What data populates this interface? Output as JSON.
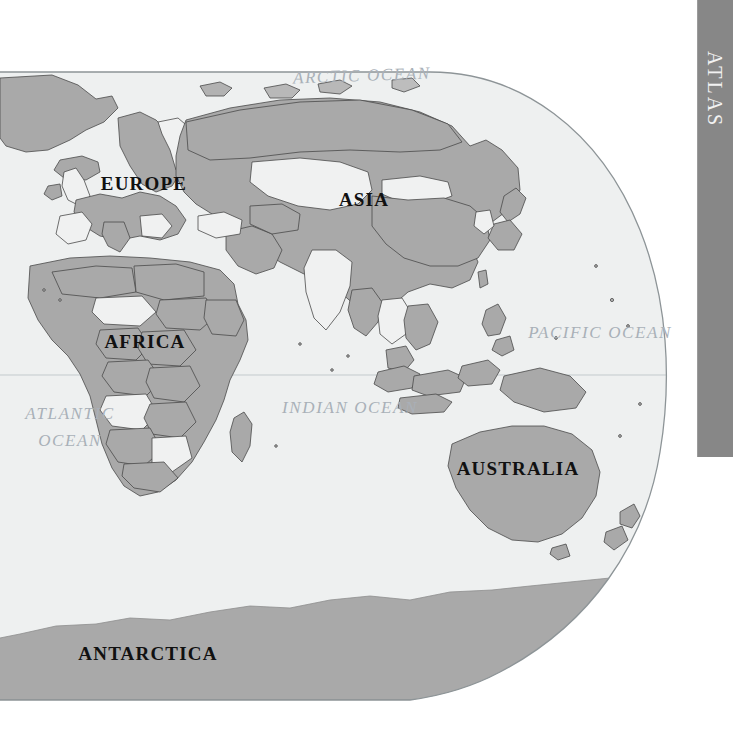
{
  "page": {
    "kind": "atlas-world-map-page",
    "background_color": "#ffffff",
    "width": 733,
    "height": 732
  },
  "tab": {
    "label": "ATLAS",
    "color": "#878787",
    "text_color": "#f2f2f2",
    "orientation": "vertical"
  },
  "map": {
    "projection_note": "oval / elliptical eastern-hemisphere world map",
    "ocean_color": "#eef0f0",
    "land_color": "#a9a9a9",
    "land_alt_color": "#f0f1f1",
    "border_color": "#4a4a4a",
    "outline_color": "#9aa0a3",
    "equator_color": "#b9c2c6",
    "continent_labels": [
      {
        "name": "europe",
        "text": "EUROPE",
        "x": 144,
        "y": 190,
        "size": 19
      },
      {
        "name": "asia",
        "text": "ASIA",
        "x": 364,
        "y": 206,
        "size": 19
      },
      {
        "name": "africa",
        "text": "AFRICA",
        "x": 145,
        "y": 348,
        "size": 19
      },
      {
        "name": "australia",
        "text": "AUSTRALIA",
        "x": 518,
        "y": 475,
        "size": 19
      },
      {
        "name": "antarctica",
        "text": "ANTARCTICA",
        "x": 148,
        "y": 660,
        "size": 19
      }
    ],
    "ocean_labels": [
      {
        "name": "arctic-ocean",
        "text": "ARCTIC OCEAN",
        "x": 362,
        "y": 81,
        "size": 17,
        "rotate": -2
      },
      {
        "name": "pacific-ocean",
        "text": "PACIFIC OCEAN",
        "x": 600,
        "y": 338,
        "size": 17,
        "rotate": 0
      },
      {
        "name": "indian-ocean",
        "text": "INDIAN OCEAN",
        "x": 350,
        "y": 413,
        "size": 17,
        "rotate": 0
      },
      {
        "name": "atlantic-ocean-line1",
        "text": "ATLANTIC",
        "x": 70,
        "y": 419,
        "size": 17,
        "rotate": 0
      },
      {
        "name": "atlantic-ocean-line2",
        "text": "OCEAN",
        "x": 70,
        "y": 446,
        "size": 17,
        "rotate": 0
      }
    ]
  }
}
